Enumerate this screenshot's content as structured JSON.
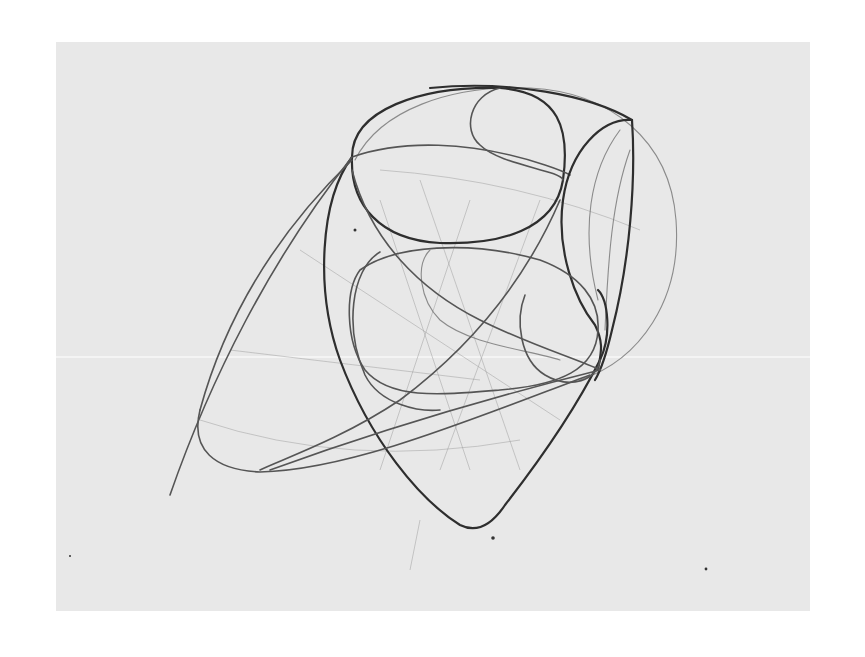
{
  "artwork": {
    "subject": "pencil construction sketch of interlocking ellipses and curved forms",
    "medium": "graphite on paper",
    "colors": {
      "page_background": "#ffffff",
      "paper": "#e8e8e8",
      "heavy_line": "#2e2e2e",
      "construction_line": "#7a7a7a"
    }
  }
}
